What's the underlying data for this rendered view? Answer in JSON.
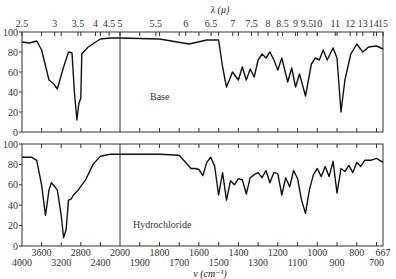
{
  "chart_data": {
    "type": "line",
    "title": "",
    "top_axis": {
      "label": "λ (μ)",
      "ticks": [
        "2.5",
        "3",
        "3.5",
        "4",
        "4.5",
        "5",
        "5.5",
        "6",
        "6.5",
        "7",
        "7.5",
        "8",
        "8.5",
        "9",
        "9.5",
        "10",
        "11",
        "12",
        "13",
        "14",
        "15"
      ]
    },
    "bottom_axis": {
      "label": "ν (cm⁻¹)",
      "ticks_upper": [
        "3600",
        "2800",
        "2000",
        "1800",
        "1600",
        "1400",
        "1200",
        "1000",
        "800",
        "667"
      ],
      "ticks_lower": [
        "4000",
        "3200",
        "2400",
        "1900",
        "1700",
        "1500",
        "1300",
        "1100",
        "900",
        "700"
      ]
    },
    "ylabel": "Transmittance (%)",
    "yticks": [
      "100",
      "80",
      "60",
      "40",
      "20",
      "0"
    ],
    "ylim": [
      0,
      100
    ],
    "panels": [
      {
        "name": "Base",
        "series": [
          {
            "x": 4000,
            "y": 90
          },
          {
            "x": 3850,
            "y": 89
          },
          {
            "x": 3700,
            "y": 91
          },
          {
            "x": 3600,
            "y": 82
          },
          {
            "x": 3450,
            "y": 52
          },
          {
            "x": 3350,
            "y": 48
          },
          {
            "x": 3280,
            "y": 43
          },
          {
            "x": 3150,
            "y": 65
          },
          {
            "x": 3050,
            "y": 80
          },
          {
            "x": 2980,
            "y": 79
          },
          {
            "x": 2930,
            "y": 40
          },
          {
            "x": 2880,
            "y": 12
          },
          {
            "x": 2840,
            "y": 28
          },
          {
            "x": 2800,
            "y": 34
          },
          {
            "x": 2780,
            "y": 78
          },
          {
            "x": 2650,
            "y": 85
          },
          {
            "x": 2400,
            "y": 93
          },
          {
            "x": 2200,
            "y": 94
          },
          {
            "x": 2000,
            "y": 94
          },
          {
            "x": 1800,
            "y": 93
          },
          {
            "x": 1650,
            "y": 88
          },
          {
            "x": 1560,
            "y": 92
          },
          {
            "x": 1500,
            "y": 92
          },
          {
            "x": 1480,
            "y": 65
          },
          {
            "x": 1460,
            "y": 45
          },
          {
            "x": 1430,
            "y": 60
          },
          {
            "x": 1400,
            "y": 52
          },
          {
            "x": 1380,
            "y": 65
          },
          {
            "x": 1360,
            "y": 52
          },
          {
            "x": 1340,
            "y": 63
          },
          {
            "x": 1320,
            "y": 55
          },
          {
            "x": 1300,
            "y": 72
          },
          {
            "x": 1280,
            "y": 78
          },
          {
            "x": 1260,
            "y": 74
          },
          {
            "x": 1240,
            "y": 80
          },
          {
            "x": 1220,
            "y": 72
          },
          {
            "x": 1200,
            "y": 62
          },
          {
            "x": 1180,
            "y": 74
          },
          {
            "x": 1150,
            "y": 50
          },
          {
            "x": 1130,
            "y": 64
          },
          {
            "x": 1110,
            "y": 45
          },
          {
            "x": 1090,
            "y": 58
          },
          {
            "x": 1060,
            "y": 36
          },
          {
            "x": 1030,
            "y": 68
          },
          {
            "x": 1010,
            "y": 74
          },
          {
            "x": 990,
            "y": 72
          },
          {
            "x": 970,
            "y": 82
          },
          {
            "x": 950,
            "y": 72
          },
          {
            "x": 920,
            "y": 84
          },
          {
            "x": 900,
            "y": 74
          },
          {
            "x": 880,
            "y": 20
          },
          {
            "x": 860,
            "y": 52
          },
          {
            "x": 830,
            "y": 78
          },
          {
            "x": 800,
            "y": 88
          },
          {
            "x": 770,
            "y": 80
          },
          {
            "x": 740,
            "y": 85
          },
          {
            "x": 700,
            "y": 86
          },
          {
            "x": 667,
            "y": 83
          }
        ]
      },
      {
        "name": "Hydrochloride",
        "series": [
          {
            "x": 4000,
            "y": 87
          },
          {
            "x": 3800,
            "y": 87
          },
          {
            "x": 3700,
            "y": 84
          },
          {
            "x": 3600,
            "y": 60
          },
          {
            "x": 3520,
            "y": 30
          },
          {
            "x": 3450,
            "y": 55
          },
          {
            "x": 3400,
            "y": 62
          },
          {
            "x": 3330,
            "y": 58
          },
          {
            "x": 3280,
            "y": 55
          },
          {
            "x": 3200,
            "y": 30
          },
          {
            "x": 3150,
            "y": 8
          },
          {
            "x": 3100,
            "y": 16
          },
          {
            "x": 3050,
            "y": 45
          },
          {
            "x": 3000,
            "y": 46
          },
          {
            "x": 2950,
            "y": 50
          },
          {
            "x": 2850,
            "y": 55
          },
          {
            "x": 2700,
            "y": 65
          },
          {
            "x": 2550,
            "y": 80
          },
          {
            "x": 2400,
            "y": 88
          },
          {
            "x": 2200,
            "y": 90
          },
          {
            "x": 2000,
            "y": 90
          },
          {
            "x": 1800,
            "y": 90
          },
          {
            "x": 1700,
            "y": 89
          },
          {
            "x": 1640,
            "y": 76
          },
          {
            "x": 1620,
            "y": 76
          },
          {
            "x": 1600,
            "y": 75
          },
          {
            "x": 1580,
            "y": 69
          },
          {
            "x": 1560,
            "y": 82
          },
          {
            "x": 1540,
            "y": 87
          },
          {
            "x": 1520,
            "y": 78
          },
          {
            "x": 1500,
            "y": 50
          },
          {
            "x": 1480,
            "y": 72
          },
          {
            "x": 1460,
            "y": 45
          },
          {
            "x": 1440,
            "y": 64
          },
          {
            "x": 1420,
            "y": 60
          },
          {
            "x": 1400,
            "y": 66
          },
          {
            "x": 1380,
            "y": 65
          },
          {
            "x": 1360,
            "y": 51
          },
          {
            "x": 1340,
            "y": 67
          },
          {
            "x": 1320,
            "y": 70
          },
          {
            "x": 1300,
            "y": 72
          },
          {
            "x": 1280,
            "y": 67
          },
          {
            "x": 1260,
            "y": 74
          },
          {
            "x": 1240,
            "y": 62
          },
          {
            "x": 1220,
            "y": 72
          },
          {
            "x": 1200,
            "y": 71
          },
          {
            "x": 1180,
            "y": 50
          },
          {
            "x": 1160,
            "y": 67
          },
          {
            "x": 1140,
            "y": 58
          },
          {
            "x": 1120,
            "y": 74
          },
          {
            "x": 1100,
            "y": 66
          },
          {
            "x": 1080,
            "y": 45
          },
          {
            "x": 1060,
            "y": 32
          },
          {
            "x": 1040,
            "y": 55
          },
          {
            "x": 1020,
            "y": 70
          },
          {
            "x": 1000,
            "y": 76
          },
          {
            "x": 980,
            "y": 68
          },
          {
            "x": 960,
            "y": 78
          },
          {
            "x": 940,
            "y": 68
          },
          {
            "x": 920,
            "y": 83
          },
          {
            "x": 900,
            "y": 52
          },
          {
            "x": 880,
            "y": 76
          },
          {
            "x": 860,
            "y": 73
          },
          {
            "x": 840,
            "y": 79
          },
          {
            "x": 820,
            "y": 72
          },
          {
            "x": 800,
            "y": 82
          },
          {
            "x": 780,
            "y": 78
          },
          {
            "x": 760,
            "y": 84
          },
          {
            "x": 730,
            "y": 84
          },
          {
            "x": 700,
            "y": 86
          },
          {
            "x": 667,
            "y": 82
          }
        ]
      }
    ],
    "annotations": [
      "Base",
      "Hydrochloride"
    ],
    "grid": false,
    "scale_break_x": 2000
  }
}
